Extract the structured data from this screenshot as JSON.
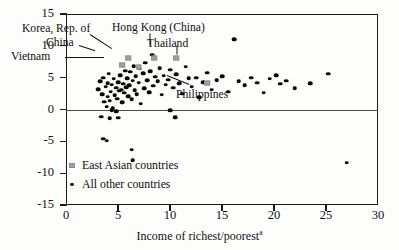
{
  "chart_data": {
    "type": "scatter",
    "title": "",
    "xlabel": "Income of richest/poorest",
    "xlabel_superscript": "a",
    "ylabel": "",
    "xlim": [
      0,
      30
    ],
    "ylim": [
      -15,
      15
    ],
    "xticks": [
      0,
      5,
      10,
      15,
      20,
      25,
      30
    ],
    "yticks": [
      -15,
      -10,
      -5,
      0,
      5,
      10,
      15
    ],
    "xtick_labels": [
      "0",
      "5",
      "10",
      "15",
      "20",
      "25",
      "30"
    ],
    "ytick_labels": [
      "-15",
      "-10",
      "-5",
      "0",
      "5",
      "10",
      "15"
    ],
    "grid": false,
    "zero_reference_line": 0,
    "legend": {
      "position": "inside-lower-left",
      "entries": [
        {
          "label": "East Asian countries",
          "marker": "gray-square"
        },
        {
          "label": "All other countries",
          "marker": "black-dot"
        }
      ]
    },
    "series": [
      {
        "name": "East Asian countries",
        "marker": "gray-square",
        "color": "#a0a0a0",
        "points": [
          {
            "label": "China",
            "x": 5.4,
            "y": 7.0
          },
          {
            "label": "Korea, Rep. of",
            "x": 6.0,
            "y": 8.1
          },
          {
            "label": "Vietnam",
            "x": 7.0,
            "y": 6.6
          },
          {
            "label": "Hong Kong (China)",
            "x": 8.5,
            "y": 8.1
          },
          {
            "label": "Thailand",
            "x": 10.6,
            "y": 8.1
          },
          {
            "label": "Philippines",
            "x": 13.6,
            "y": 4.1
          }
        ]
      },
      {
        "name": "All other countries",
        "marker": "black-dot",
        "color": "#080808",
        "points": [
          {
            "x": 3.1,
            "y": 3.2
          },
          {
            "x": 3.3,
            "y": 4.4
          },
          {
            "x": 3.5,
            "y": 2.4
          },
          {
            "x": 3.6,
            "y": 5.0
          },
          {
            "x": 3.7,
            "y": 1.2
          },
          {
            "x": 3.8,
            "y": 3.6
          },
          {
            "x": 3.9,
            "y": 0.4
          },
          {
            "x": 4.0,
            "y": 2.0
          },
          {
            "x": 4.0,
            "y": 4.1
          },
          {
            "x": 4.1,
            "y": 5.6
          },
          {
            "x": 4.2,
            "y": 1.4
          },
          {
            "x": 4.3,
            "y": 2.8
          },
          {
            "x": 4.4,
            "y": 3.9
          },
          {
            "x": 4.5,
            "y": 0.2
          },
          {
            "x": 4.6,
            "y": 4.8
          },
          {
            "x": 4.7,
            "y": 2.2
          },
          {
            "x": 4.8,
            "y": 3.4
          },
          {
            "x": 4.9,
            "y": 1.7
          },
          {
            "x": 5.0,
            "y": 4.3
          },
          {
            "x": 5.1,
            "y": 2.9
          },
          {
            "x": 5.2,
            "y": 5.4
          },
          {
            "x": 5.3,
            "y": 3.1
          },
          {
            "x": 5.4,
            "y": 1.1
          },
          {
            "x": 5.5,
            "y": 4.0
          },
          {
            "x": 5.6,
            "y": 2.6
          },
          {
            "x": 5.7,
            "y": 6.1
          },
          {
            "x": 5.8,
            "y": 3.5
          },
          {
            "x": 5.9,
            "y": 4.9
          },
          {
            "x": 6.0,
            "y": 2.1
          },
          {
            "x": 6.1,
            "y": 3.8
          },
          {
            "x": 6.2,
            "y": 5.9
          },
          {
            "x": 6.3,
            "y": 1.6
          },
          {
            "x": 6.4,
            "y": 4.5
          },
          {
            "x": 6.5,
            "y": 6.8
          },
          {
            "x": 6.6,
            "y": 3.0
          },
          {
            "x": 6.7,
            "y": 5.2
          },
          {
            "x": 6.8,
            "y": 2.4
          },
          {
            "x": 7.0,
            "y": 4.2
          },
          {
            "x": 7.1,
            "y": 6.4
          },
          {
            "x": 7.2,
            "y": 0.9
          },
          {
            "x": 7.4,
            "y": 5.7
          },
          {
            "x": 7.5,
            "y": 3.3
          },
          {
            "x": 7.6,
            "y": 7.3
          },
          {
            "x": 7.8,
            "y": 4.6
          },
          {
            "x": 8.0,
            "y": 2.7
          },
          {
            "x": 8.1,
            "y": 6.0
          },
          {
            "x": 8.3,
            "y": 8.6
          },
          {
            "x": 8.4,
            "y": 3.7
          },
          {
            "x": 8.6,
            "y": 5.1
          },
          {
            "x": 8.8,
            "y": 4.4
          },
          {
            "x": 9.0,
            "y": 6.5
          },
          {
            "x": 9.2,
            "y": 2.3
          },
          {
            "x": 9.4,
            "y": 5.3
          },
          {
            "x": 9.6,
            "y": 3.9
          },
          {
            "x": 9.8,
            "y": 4.7
          },
          {
            "x": 10.0,
            "y": 6.2
          },
          {
            "x": 10.3,
            "y": 3.4
          },
          {
            "x": 10.6,
            "y": 5.5
          },
          {
            "x": 10.9,
            "y": 4.1
          },
          {
            "x": 11.2,
            "y": 2.5
          },
          {
            "x": 11.5,
            "y": 6.7
          },
          {
            "x": 11.8,
            "y": 4.9
          },
          {
            "x": 12.1,
            "y": 3.6
          },
          {
            "x": 12.5,
            "y": 5.0
          },
          {
            "x": 12.8,
            "y": 1.9
          },
          {
            "x": 13.2,
            "y": 4.3
          },
          {
            "x": 13.6,
            "y": 5.8
          },
          {
            "x": 14.0,
            "y": 3.1
          },
          {
            "x": 14.5,
            "y": 4.6
          },
          {
            "x": 15.0,
            "y": 5.2
          },
          {
            "x": 15.6,
            "y": 2.8
          },
          {
            "x": 16.2,
            "y": 11.0
          },
          {
            "x": 16.6,
            "y": 4.4
          },
          {
            "x": 17.2,
            "y": 3.8
          },
          {
            "x": 17.8,
            "y": 5.0
          },
          {
            "x": 18.4,
            "y": 4.2
          },
          {
            "x": 19.0,
            "y": 2.6
          },
          {
            "x": 19.6,
            "y": 4.8
          },
          {
            "x": 20.2,
            "y": 5.4
          },
          {
            "x": 20.6,
            "y": 4.0
          },
          {
            "x": 21.2,
            "y": 4.5
          },
          {
            "x": 22.0,
            "y": 3.3
          },
          {
            "x": 23.5,
            "y": 4.1
          },
          {
            "x": 25.2,
            "y": 5.6
          },
          {
            "x": 27.0,
            "y": -8.4
          },
          {
            "x": 3.4,
            "y": -1.1
          },
          {
            "x": 3.6,
            "y": -4.6
          },
          {
            "x": 3.9,
            "y": -4.9
          },
          {
            "x": 4.2,
            "y": -1.4
          },
          {
            "x": 5.0,
            "y": -1.3
          },
          {
            "x": 6.3,
            "y": -6.3
          },
          {
            "x": 6.4,
            "y": -8.0
          },
          {
            "x": 10.5,
            "y": -1.2
          },
          {
            "x": 4.4,
            "y": -0.1
          },
          {
            "x": 10.0,
            "y": -0.1
          },
          {
            "x": 4.8,
            "y": -0.3
          }
        ]
      }
    ],
    "annotations": [
      {
        "text": "Korea, Rep. of",
        "target": "Korea, Rep. of"
      },
      {
        "text": "China",
        "target": "China"
      },
      {
        "text": "Vietnam",
        "target": "Vietnam"
      },
      {
        "text": "Hong Kong (China)",
        "target": "Hong Kong (China)"
      },
      {
        "text": "Thailand",
        "target": "Thailand"
      },
      {
        "text": "Philippines",
        "target": "Philippines"
      }
    ]
  },
  "axis": {
    "x_title": "Income of richest/poorest",
    "x_title_sup": "a",
    "y_labels": [
      "15",
      "10",
      "5",
      "0",
      "-5",
      "-10",
      "-15"
    ],
    "x_labels": [
      "0",
      "5",
      "10",
      "15",
      "20",
      "25",
      "30"
    ]
  },
  "annotations": {
    "korea": "Korea, Rep. of",
    "china": "China",
    "vietnam": "Vietnam",
    "hongkong": "Hong Kong (China)",
    "thailand": "Thailand",
    "philippines": "Philippines"
  },
  "legend": {
    "east_asian": "East Asian countries",
    "all_other": "All other countries"
  },
  "colors": {
    "east_asian_marker": "#a0a0a0",
    "other_marker": "#080808",
    "axis": "#1a1a1a",
    "zero_line": "#4a4a4a"
  }
}
